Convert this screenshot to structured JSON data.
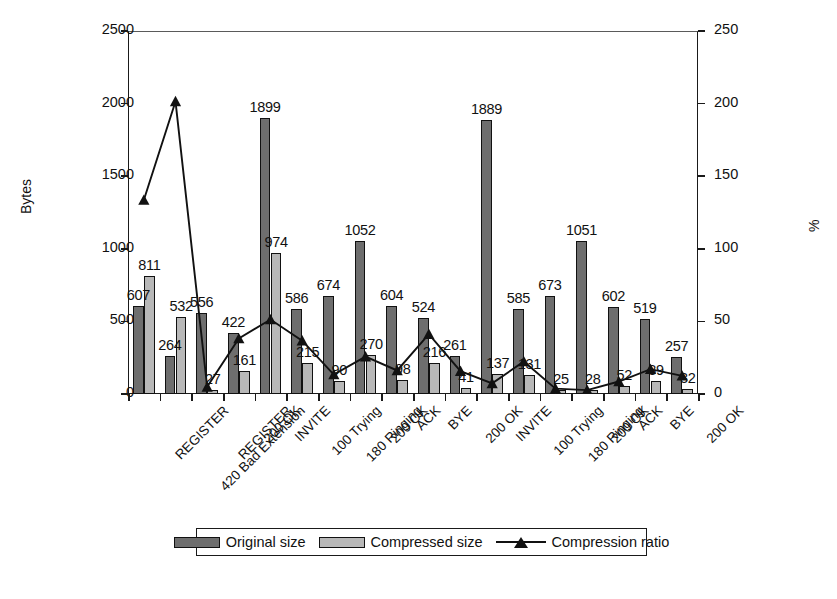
{
  "chart_data": {
    "type": "bar",
    "title": "",
    "xlabel": "",
    "ylabel": "Bytes",
    "ylabel_right": "%",
    "ylim": [
      0,
      2500
    ],
    "yticks": [
      0,
      500,
      1000,
      1500,
      2000,
      2500
    ],
    "ylim_right": [
      0,
      250
    ],
    "yticks_right": [
      0,
      50,
      100,
      150,
      200,
      250
    ],
    "grid": false,
    "legend_position": "bottom",
    "categories": [
      "REGISTER",
      "420 Bad Extension",
      "REGISTER",
      "200 OK",
      "INVITE",
      "100 Trying",
      "180 Ringing",
      "200 OK",
      "ACK",
      "BYE",
      "200 OK",
      "INVITE",
      "100 Trying",
      "180 Ringing",
      "200 OK",
      "ACK",
      "BYE",
      "200 OK"
    ],
    "series": [
      {
        "name": "Original size",
        "axis": "left",
        "color": "#6e6e6e",
        "values": [
          607,
          264,
          556,
          422,
          1899,
          586,
          674,
          1052,
          604,
          524,
          261,
          1889,
          585,
          673,
          1051,
          602,
          519,
          257
        ]
      },
      {
        "name": "Compressed size",
        "axis": "left",
        "color": "#b8b8b8",
        "values": [
          811,
          532,
          27,
          161,
          974,
          215,
          90,
          270,
          98,
          216,
          41,
          137,
          131,
          25,
          28,
          52,
          89,
          32
        ]
      },
      {
        "name": "Compression ratio",
        "axis": "right",
        "color": "#111111",
        "marker": "triangle",
        "values": [
          133.6,
          201.5,
          4.9,
          38.2,
          51.3,
          36.7,
          13.4,
          25.7,
          16.2,
          41.2,
          15.7,
          7.3,
          22.4,
          3.7,
          2.7,
          8.6,
          17.1,
          12.5
        ]
      }
    ]
  },
  "legend": {
    "items": [
      {
        "label": "Original size",
        "kind": "swatch-dark"
      },
      {
        "label": "Compressed size",
        "kind": "swatch-light"
      },
      {
        "label": "Compression ratio",
        "kind": "line-marker"
      }
    ]
  }
}
